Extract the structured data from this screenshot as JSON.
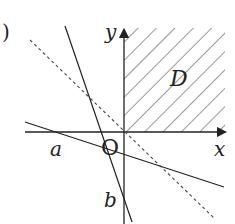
{
  "diagram": {
    "labels": {
      "y_axis": "y",
      "x_axis": "x",
      "origin": "O",
      "region": "D",
      "point_a": "a",
      "point_b": "b",
      "paren": ")",
      "top_fragment": "g"
    },
    "colors": {
      "stroke": "#222222",
      "background": "#ffffff"
    }
  }
}
